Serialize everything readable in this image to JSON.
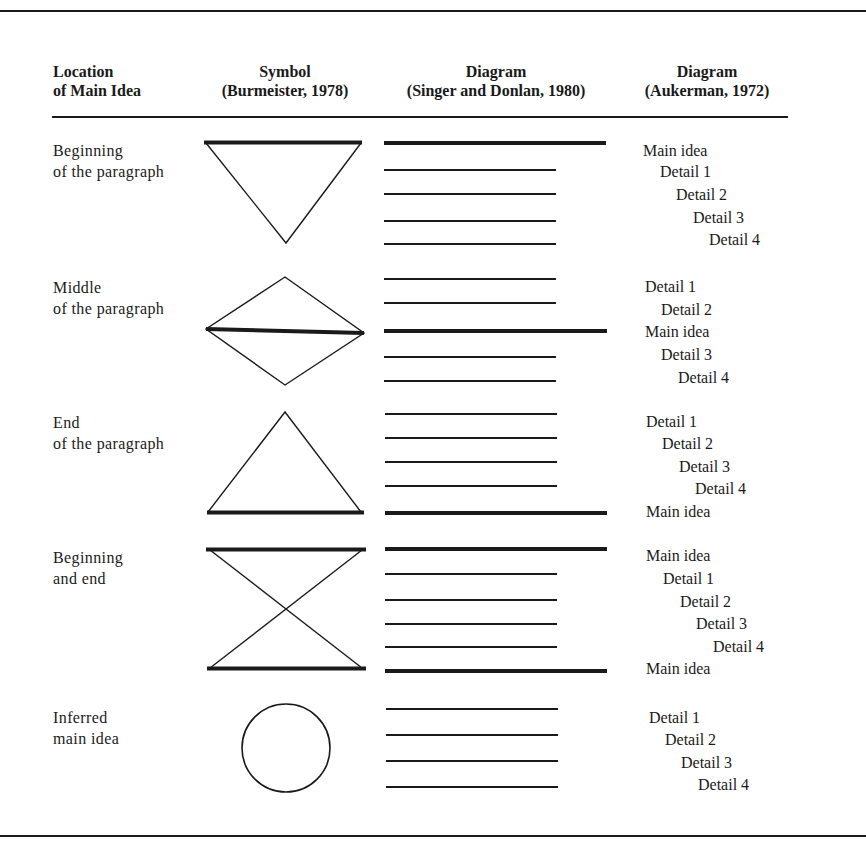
{
  "table": {
    "headers": [
      {
        "line1": "Location",
        "line2": "of Main Idea"
      },
      {
        "line1": "Symbol",
        "line2": "(Burmeister, 1978)"
      },
      {
        "line1": "Diagram",
        "line2": "(Singer and Donlan, 1980)"
      },
      {
        "line1": "Diagram",
        "line2": "(Aukerman, 1972)"
      }
    ],
    "rows": [
      {
        "location": {
          "line1": "Beginning",
          "line2": "of the paragraph"
        },
        "symbol": "inverted-triangle",
        "aukerman": [
          "Main idea",
          "Detail 1",
          "Detail 2",
          "Detail 3",
          "Detail 4"
        ]
      },
      {
        "location": {
          "line1": "Middle",
          "line2": "of the paragraph"
        },
        "symbol": "diamond",
        "aukerman": [
          "Detail 1",
          "Detail 2",
          "Main idea",
          "Detail 3",
          "Detail 4"
        ]
      },
      {
        "location": {
          "line1": "End",
          "line2": "of the paragraph"
        },
        "symbol": "triangle",
        "aukerman": [
          "Detail 1",
          "Detail 2",
          "Detail 3",
          "Detail 4",
          "Main idea"
        ]
      },
      {
        "location": {
          "line1": "Beginning",
          "line2": "and end"
        },
        "symbol": "hourglass",
        "aukerman": [
          "Main idea",
          "Detail 1",
          "Detail 2",
          "Detail 3",
          "Detail 4",
          "Main idea"
        ]
      },
      {
        "location": {
          "line1": "Inferred",
          "line2": "main idea"
        },
        "symbol": "circle",
        "aukerman": [
          "Detail 1",
          "Detail 2",
          "Detail 3",
          "Detail 4"
        ]
      }
    ]
  },
  "colors": {
    "ink": "#1a1a1a",
    "paper": "#ffffff"
  }
}
